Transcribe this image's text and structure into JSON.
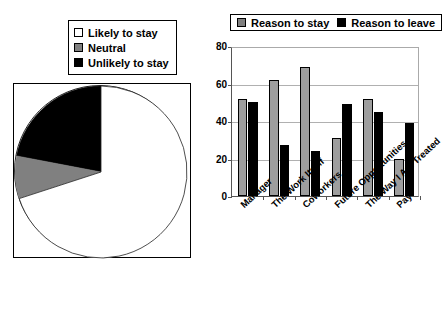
{
  "pie": {
    "legend": [
      {
        "label": "Likely to stay",
        "swatch": "white",
        "color": "#ffffff"
      },
      {
        "label": "Neutral",
        "swatch": "gray",
        "color": "#808080"
      },
      {
        "label": "Unlikely to stay",
        "swatch": "black",
        "color": "#000000"
      }
    ]
  },
  "bar": {
    "legend": [
      {
        "label": "Reason to stay",
        "swatch": "gray",
        "color": "#9e9e9e"
      },
      {
        "label": "Reason to leave",
        "swatch": "black",
        "color": "#000000"
      }
    ],
    "yticks": [
      "0",
      "20",
      "40",
      "60",
      "80"
    ]
  },
  "chart_data": [
    {
      "type": "pie",
      "title": "",
      "labels": [
        "Likely to stay",
        "Neutral",
        "Unlikely to stay"
      ],
      "values": [
        70,
        8,
        22
      ],
      "colors": [
        "#ffffff",
        "#808080",
        "#000000"
      ],
      "legend_position": "top-left",
      "notes": "Slices drawn clockwise starting at 12 o'clock going counter-clockwise: black wedge occupies upper-left quadrant, gray wedge below it, white remainder."
    },
    {
      "type": "bar",
      "title": "",
      "xlabel": "",
      "ylabel": "",
      "ylim": [
        0,
        80
      ],
      "yticks": [
        0,
        20,
        40,
        60,
        80
      ],
      "grid": true,
      "legend_position": "top",
      "categories": [
        "Manager",
        "The Work Itself",
        "Coworkers",
        "Future Opportunities",
        "The Way I Am Treated",
        "Pay"
      ],
      "series": [
        {
          "name": "Reason to stay",
          "color": "#9e9e9e",
          "values": [
            52,
            62,
            69,
            31,
            52,
            20
          ]
        },
        {
          "name": "Reason to leave",
          "color": "#000000",
          "values": [
            50,
            27,
            24,
            49,
            45,
            39
          ]
        }
      ]
    }
  ]
}
